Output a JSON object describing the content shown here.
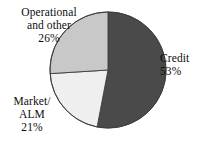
{
  "chart_data": {
    "type": "pie",
    "title": "",
    "subtitle": "",
    "xlabel": "",
    "ylabel": "",
    "legend_position": "none",
    "grid": false,
    "labels_inline": true,
    "categories": [
      "Credit",
      "Market/ALM",
      "Operational and other"
    ],
    "values": [
      53,
      21,
      26
    ],
    "unit": "%",
    "slices": [
      {
        "name": "credit",
        "label_lines": [
          "Credit"
        ],
        "percent_text": "53%",
        "value": 53,
        "color": "#4a4a4a",
        "start_angle_deg": 0,
        "end_angle_deg": 190.8,
        "label_position": "right-outside"
      },
      {
        "name": "market-alm",
        "label_lines": [
          "Market/",
          "ALM"
        ],
        "percent_text": "21%",
        "value": 21,
        "color": "#efefef",
        "start_angle_deg": 190.8,
        "end_angle_deg": 266.4,
        "label_position": "bottom-left-outside"
      },
      {
        "name": "operational-and-other",
        "label_lines": [
          "Operational",
          "and other"
        ],
        "percent_text": "26%",
        "value": 26,
        "color": "#c8c8c8",
        "start_angle_deg": 266.4,
        "end_angle_deg": 360,
        "label_position": "top-left-outside"
      }
    ],
    "geometry": {
      "center_x": 108,
      "center_y": 70,
      "radius": 58,
      "start_angle_deg": 0,
      "direction": "clockwise"
    },
    "style": {
      "background": "#ffffff",
      "outline_color": "#3c3c3c",
      "outline_width": 0.9,
      "text_color": "#0d0d0d"
    }
  }
}
